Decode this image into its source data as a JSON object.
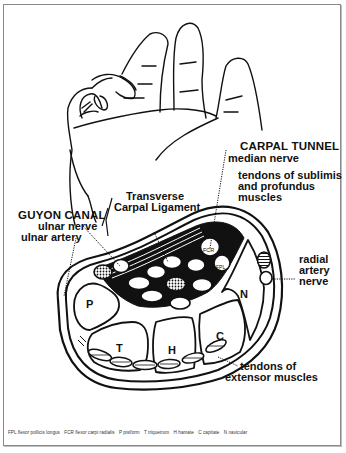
{
  "labels": {
    "carpal_tunnel": {
      "title": "CARPAL TUNNEL",
      "sub": "median nerve"
    },
    "tendons_flexor": [
      "tendons of sublimis",
      "and profundus",
      "muscles"
    ],
    "transverse": [
      "Transverse",
      "Carpal Ligament"
    ],
    "guyon": {
      "title": "GUYON CANAL",
      "lines": [
        "ulnar nerve",
        "ulnar artery"
      ]
    },
    "radial": [
      "radial",
      "artery",
      "nerve"
    ],
    "extensor": [
      "tendons of",
      "extensor muscles"
    ]
  },
  "bones": {
    "P": "P",
    "T": "T",
    "H": "H",
    "C": "C",
    "N": "N"
  },
  "tendon_tags": {
    "fcr": "FCR",
    "fpl": "FPL"
  },
  "legend": [
    "FPL  flexor pollicis longus",
    "FCR  flexor carpi radialis",
    "P  pisiform",
    "T  triquetrum",
    "H  hamate",
    "C  capitate",
    "N  navicular"
  ],
  "colors": {
    "ink": "#111111",
    "frame": "#8a8a8a",
    "background": "#ffffff"
  }
}
